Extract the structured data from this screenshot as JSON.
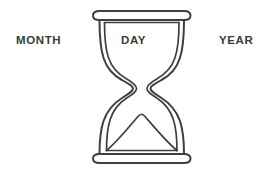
{
  "figure": {
    "name": "hourglass-diagram",
    "background_color": "#ffffff",
    "stroke_color": "#3f3f3f",
    "icon": "hourglass-icon"
  },
  "labels": {
    "left": "MONTH",
    "center": "DAY",
    "right": "YEAR",
    "text_color": "#3a3a3a"
  }
}
